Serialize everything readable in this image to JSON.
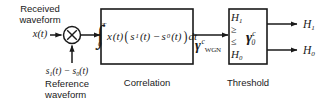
{
  "diagram": {
    "stroke_color": "#1a1a1a",
    "background_color": "#ffffff",
    "input_signal": {
      "caption_line1": "Received",
      "caption_line2": "waveform",
      "symbol_x": "x",
      "symbol_t": "(t)"
    },
    "reference_signal": {
      "expr_s1": "s",
      "expr_s1_sub": "1",
      "expr_mid": "(t) − ",
      "expr_s0": "s",
      "expr_s0_sub": "0",
      "expr_end": "(t)",
      "caption_line1": "Reference",
      "caption_line2": "waveform"
    },
    "multiplier": {
      "symbol": "×",
      "name": "multiplier-node"
    },
    "correlation_block": {
      "caption": "Correlation",
      "integral_glyph": "∫",
      "limit_upper": "T",
      "limit_lower": "0",
      "integrand_x": "x",
      "integrand_xt": "(t)",
      "paren_open": "(",
      "integrand_s1": "s",
      "integrand_s1_sub": "1",
      "integrand_mid": "(t) − ",
      "integrand_s0": "s",
      "integrand_s0_sub": "0",
      "integrand_s0_t": "(t)",
      "paren_close": ")",
      "differential": "dt"
    },
    "gamma_wgn_label": {
      "symbol": "γ",
      "superscript": "c",
      "subscript": "WGN"
    },
    "threshold_block": {
      "caption": "Threshold",
      "hypothesis_upper": "H",
      "hypothesis_upper_sub": "1",
      "compare_geq": "≥",
      "compare_leq": "≤",
      "hypothesis_lower": "H",
      "hypothesis_lower_sub": "0",
      "gamma_symbol": "γ",
      "gamma_superscript": "c",
      "gamma_subscript": "0"
    },
    "outputs": {
      "top": "H",
      "top_sub": "1",
      "bottom": "H",
      "bottom_sub": "0"
    }
  }
}
